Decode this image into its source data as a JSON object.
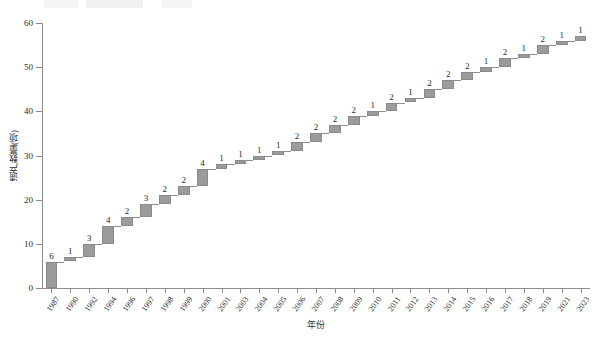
{
  "chart_data": {
    "type": "bar",
    "subtype": "waterfall-cumulative",
    "title": "",
    "xlabel": "年份",
    "ylabel": "遗产数量(项)",
    "ylim": [
      0,
      60
    ],
    "yticks": [
      0,
      10,
      20,
      30,
      40,
      50,
      60
    ],
    "grid": false,
    "legend": "none",
    "categories": [
      "1987",
      "1990",
      "1992",
      "1994",
      "1996",
      "1997",
      "1998",
      "1999",
      "2000",
      "2001",
      "2003",
      "2004",
      "2005",
      "2006",
      "2007",
      "2008",
      "2009",
      "2010",
      "2011",
      "2012",
      "2013",
      "2014",
      "2015",
      "2016",
      "2017",
      "2018",
      "2019",
      "2021",
      "2023"
    ],
    "values": [
      6,
      1,
      3,
      4,
      2,
      3,
      2,
      2,
      4,
      1,
      1,
      1,
      1,
      2,
      2,
      2,
      2,
      1,
      2,
      1,
      2,
      2,
      2,
      1,
      2,
      1,
      2,
      1,
      1
    ],
    "cumulative": [
      6,
      7,
      10,
      14,
      16,
      19,
      21,
      23,
      27,
      28,
      29,
      30,
      31,
      33,
      35,
      37,
      39,
      40,
      42,
      43,
      45,
      47,
      49,
      50,
      52,
      53,
      55,
      56,
      57
    ],
    "data_labels": [
      "6",
      "1",
      "3",
      "4",
      "2",
      "3",
      "2",
      "2",
      "4",
      "1",
      "1",
      "1",
      "1",
      "2",
      "2",
      "2",
      "2",
      "1",
      "2",
      "1",
      "2",
      "2",
      "2",
      "1",
      "2",
      "1",
      "2",
      "1",
      "1"
    ],
    "bar_color": "#9b9b9b",
    "bar_border_color": "#8a8a8a",
    "axis_color": "#8c8c8c",
    "total": 57
  },
  "caption": {
    "top_strip_text": ""
  }
}
